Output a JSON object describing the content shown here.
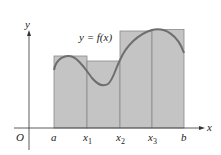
{
  "diagram": {
    "type": "riemann-sum-rectangles",
    "function_label": "y = f(x)",
    "axes": {
      "x_label": "x",
      "y_label": "y",
      "origin_label": "O"
    },
    "x_ticks": [
      {
        "label": "a",
        "sub": ""
      },
      {
        "label": "x",
        "sub": "1"
      },
      {
        "label": "x",
        "sub": "2"
      },
      {
        "label": "x",
        "sub": "3"
      },
      {
        "label": "b",
        "sub": ""
      }
    ],
    "rectangles": [
      {
        "from": "a",
        "to": "x1",
        "height_note": "max on interval"
      },
      {
        "from": "x1",
        "to": "x2",
        "height_note": "max on interval"
      },
      {
        "from": "x2",
        "to": "x3",
        "height_note": "max on interval"
      },
      {
        "from": "x3",
        "to": "b",
        "height_note": "max on interval"
      }
    ],
    "colors": {
      "rect_fill": "#c4c4c4",
      "rect_stroke": "#8a8a8a",
      "curve": "#6e6e6e",
      "axis": "#333333",
      "background": "#ffffff"
    }
  }
}
